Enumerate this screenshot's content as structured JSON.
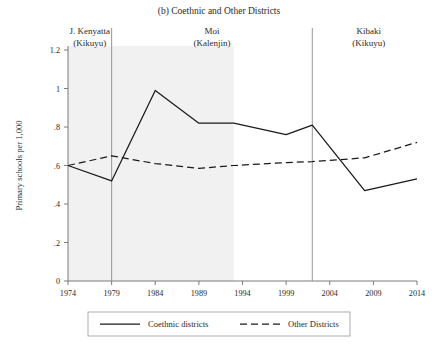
{
  "figure": {
    "title": "(b) Coethnic and Other Districts",
    "ylabel": "Primary schools per 1,000"
  },
  "periods": [
    {
      "name": "J. Kenyatta",
      "ethnicity": "(Kikuyu)",
      "start": 1974,
      "end": 1978
    },
    {
      "name": "Moi",
      "ethnicity": "(Kalenjin)",
      "start": 1979,
      "end": 2002
    },
    {
      "name": "Kibaki",
      "ethnicity": "(Kikuyu)",
      "start": 2002,
      "end": 2014
    }
  ],
  "legend": {
    "coethnic_label": "Coethnic districts",
    "other_label": "Other Districts"
  },
  "chart_data": {
    "type": "line",
    "title": "(b) Coethnic and Other Districts",
    "xlabel": "",
    "ylabel": "Primary schools per 1,000",
    "xlim": [
      1974,
      2014
    ],
    "ylim": [
      0,
      1.2
    ],
    "xticks": [
      1974,
      1979,
      1984,
      1989,
      1994,
      1999,
      2004,
      2009,
      2014
    ],
    "xticklabels": [
      "1974",
      "1979",
      "1984",
      "1989",
      "1994",
      "1999",
      "2004",
      "2009",
      "2014"
    ],
    "yticks": [
      0,
      0.2,
      0.4,
      0.6,
      0.8,
      1,
      1.2
    ],
    "yticklabels": [
      "0",
      ".2",
      ".4",
      ".6",
      ".8",
      "1",
      "1.2"
    ],
    "grid": false,
    "legend_position": "below",
    "shaded_spans": [
      [
        1974,
        1993
      ]
    ],
    "vertical_rules": [
      1979,
      2002
    ],
    "series": [
      {
        "name": "Coethnic districts",
        "style": "solid",
        "x": [
          1974,
          1979,
          1984,
          1989,
          1993,
          1999,
          2002,
          2008,
          2014
        ],
        "values": [
          0.6,
          0.52,
          0.99,
          0.82,
          0.82,
          0.76,
          0.81,
          0.47,
          0.53
        ]
      },
      {
        "name": "Other Districts",
        "style": "dashed",
        "x": [
          1974,
          1979,
          1984,
          1989,
          1993,
          1999,
          2002,
          2008,
          2014
        ],
        "values": [
          0.6,
          0.65,
          0.61,
          0.585,
          0.6,
          0.615,
          0.62,
          0.64,
          0.72
        ]
      }
    ]
  }
}
